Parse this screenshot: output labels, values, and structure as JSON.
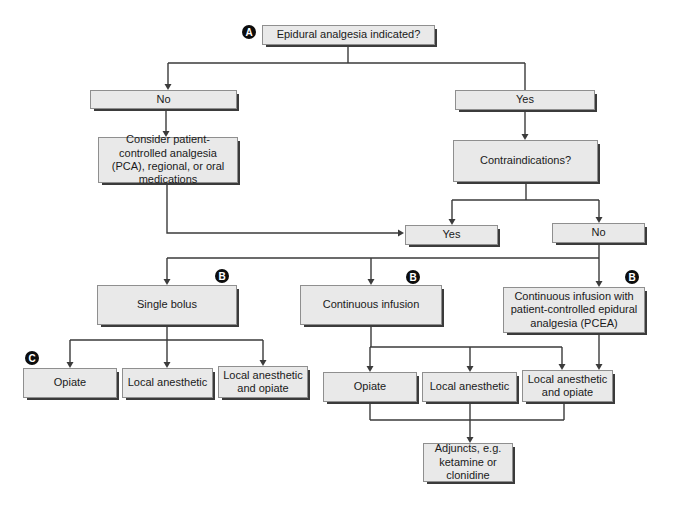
{
  "diagram": {
    "type": "flowchart",
    "badges": {
      "a": "A",
      "b": "B",
      "c": "C"
    },
    "nodes": {
      "root": {
        "label": "Epidural analgesia indicated?"
      },
      "no_initial": {
        "label": "No"
      },
      "yes_initial": {
        "label": "Yes"
      },
      "consider_pca": {
        "label": "Consider patient-controlled analgesia (PCA), regional, or oral medications"
      },
      "contraindications": {
        "label": "Contraindications?"
      },
      "contra_yes": {
        "label": "Yes"
      },
      "contra_no": {
        "label": "No"
      },
      "single_bolus": {
        "label": "Single bolus"
      },
      "continuous_infusion": {
        "label": "Continuous infusion"
      },
      "pcea": {
        "label": "Continuous infusion with patient-controlled epidural analgesia (PCEA)"
      },
      "sb_opiate": {
        "label": "Opiate"
      },
      "sb_local": {
        "label": "Local anesthetic"
      },
      "sb_local_opiate": {
        "label": "Local anesthetic and opiate"
      },
      "ci_opiate": {
        "label": "Opiate"
      },
      "ci_local": {
        "label": "Local anesthetic"
      },
      "ci_local_opiate": {
        "label": "Local anesthetic and opiate"
      },
      "adjuncts": {
        "label": "Adjuncts, e.g. ketamine or clonidine"
      }
    },
    "edges": [
      {
        "from": "root",
        "to": "no_initial"
      },
      {
        "from": "root",
        "to": "yes_initial"
      },
      {
        "from": "no_initial",
        "to": "consider_pca"
      },
      {
        "from": "yes_initial",
        "to": "contraindications"
      },
      {
        "from": "contraindications",
        "to": "contra_yes"
      },
      {
        "from": "contraindications",
        "to": "contra_no"
      },
      {
        "from": "consider_pca",
        "to": "contra_yes"
      },
      {
        "from": "contra_no",
        "to": "single_bolus"
      },
      {
        "from": "contra_no",
        "to": "continuous_infusion"
      },
      {
        "from": "contra_no",
        "to": "pcea"
      },
      {
        "from": "single_bolus",
        "to": "sb_opiate"
      },
      {
        "from": "single_bolus",
        "to": "sb_local"
      },
      {
        "from": "single_bolus",
        "to": "sb_local_opiate"
      },
      {
        "from": "continuous_infusion",
        "to": "ci_opiate"
      },
      {
        "from": "continuous_infusion",
        "to": "ci_local"
      },
      {
        "from": "continuous_infusion",
        "to": "ci_local_opiate"
      },
      {
        "from": "pcea",
        "to": "ci_local_opiate"
      },
      {
        "from": "ci_opiate",
        "to": "adjuncts"
      },
      {
        "from": "ci_local",
        "to": "adjuncts"
      },
      {
        "from": "ci_local_opiate",
        "to": "adjuncts"
      }
    ],
    "colors": {
      "background": "#ffffff",
      "box_fill": "#e9e9e9",
      "box_border": "#8f8f8f",
      "box_shadow": "#3b3b3b",
      "line": "#3b3b3b",
      "badge_bg": "#0d0d0d",
      "badge_text": "#ffffff"
    }
  }
}
